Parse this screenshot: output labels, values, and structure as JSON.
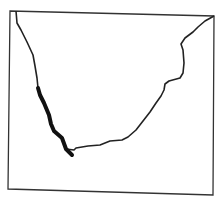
{
  "map": {
    "subject": "Southern Africa coastline outline",
    "frame_color": "#333333",
    "coast_color": "#222222",
    "highlight_color": "#111111",
    "highlight_segment": "West coast (thick stroke)"
  },
  "caption": {
    "text": ""
  }
}
